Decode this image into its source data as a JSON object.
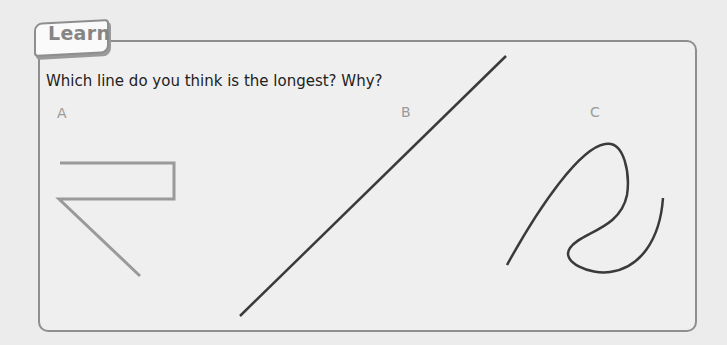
{
  "header": {
    "tab_label": "Learn"
  },
  "question": "Which line do you think is the longest? Why?",
  "options": [
    {
      "label": "A",
      "description": "zig-zag line made of straight segments",
      "color": "#9a9a9a"
    },
    {
      "label": "B",
      "description": "single straight diagonal line",
      "color": "#3a3a3a"
    },
    {
      "label": "C",
      "description": "curved looping line",
      "color": "#3a3a3a"
    }
  ]
}
